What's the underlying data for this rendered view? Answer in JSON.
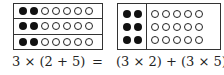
{
  "left_diagram": {
    "rows": 3,
    "filled_per_row": 2,
    "open_per_row": 5
  },
  "right_diagram": {
    "filled_group": {
      "rows": 3,
      "cols": 2
    },
    "open_group": {
      "rows": 3,
      "cols": 5
    }
  },
  "equation": {
    "left": "3 × (2 + 5)",
    "equals": "=",
    "right": "(3 × 2) + (3 × 5)"
  },
  "colors": {
    "filled_dot": "#111111",
    "line": "#333333"
  }
}
